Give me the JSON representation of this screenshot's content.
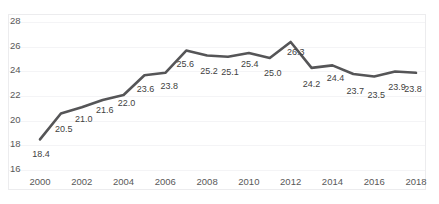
{
  "chart_data": {
    "type": "line",
    "title": "",
    "xlabel": "",
    "ylabel": "",
    "x": [
      2000,
      2001,
      2002,
      2003,
      2004,
      2005,
      2006,
      2007,
      2008,
      2009,
      2010,
      2011,
      2012,
      2013,
      2014,
      2015,
      2016,
      2017,
      2018
    ],
    "values": [
      18.4,
      20.5,
      21.0,
      21.6,
      22.0,
      23.6,
      23.8,
      25.6,
      25.2,
      25.1,
      25.4,
      25.0,
      26.3,
      24.2,
      24.4,
      23.7,
      23.5,
      23.9,
      23.8
    ],
    "point_labels": [
      "18.4",
      "20.5",
      "21.0",
      "21.6",
      "22.0",
      "23.6",
      "23.8",
      "25.6",
      "25.2",
      "25.1",
      "25.4",
      "25.0",
      "26.3",
      "24.2",
      "24.4",
      "23.7",
      "23.5",
      "23.9",
      "23.8"
    ],
    "ylim": [
      16,
      28
    ],
    "xlim": [
      2000,
      2018
    ],
    "yticks": [
      16,
      18,
      20,
      22,
      24,
      26,
      28
    ],
    "ytick_labels": [
      "16",
      "18",
      "20",
      "22",
      "24",
      "26",
      "28"
    ],
    "xticks": [
      2000,
      2002,
      2004,
      2006,
      2008,
      2010,
      2012,
      2014,
      2016,
      2018
    ],
    "xtick_labels": [
      "2000",
      "2002",
      "2004",
      "2006",
      "2008",
      "2010",
      "2012",
      "2014",
      "2016",
      "2018"
    ],
    "grid": true,
    "legend": false,
    "series_color": "#555557",
    "grid_color": "#f4f4f6",
    "border_color": "#ececee",
    "label_color": "#3f3f41",
    "tick_color": "#595959",
    "line_width": 2.6
  }
}
